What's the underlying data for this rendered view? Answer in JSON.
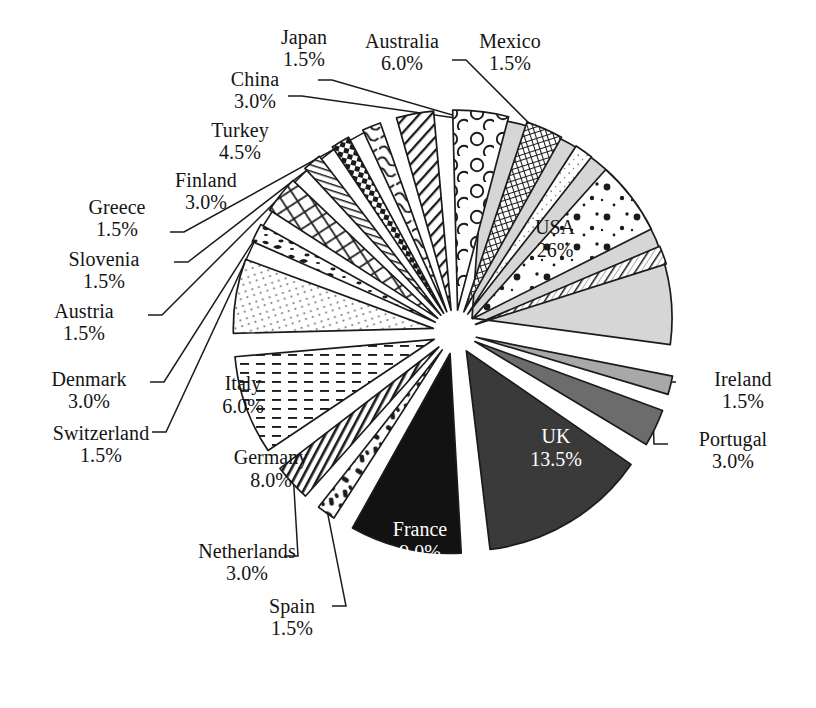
{
  "chart_data": {
    "type": "pie",
    "title": "",
    "subtitle": "",
    "xlabel": "",
    "ylabel": "",
    "legend_position": "none",
    "grid": false,
    "exploded": true,
    "value_unit": "%",
    "center": {
      "x": 455,
      "y": 332
    },
    "radius": 200,
    "categories": [
      "USA",
      "Ireland",
      "Portugal",
      "UK",
      "France",
      "Spain",
      "Netherlands",
      "Germany",
      "Italy",
      "Switzerland",
      "Denmark",
      "Austria",
      "Slovenia",
      "Greece",
      "Finland",
      "Turkey",
      "China",
      "Japan",
      "Australia",
      "Mexico"
    ],
    "values": [
      26.0,
      1.5,
      3.0,
      13.5,
      9.0,
      1.5,
      3.0,
      8.0,
      6.0,
      1.5,
      3.0,
      1.5,
      1.5,
      3.0,
      4.5,
      1.5,
      3.0,
      1.5,
      6.0,
      1.5
    ],
    "slices": [
      {
        "label": "USA",
        "value": 26.0,
        "pct_text": "26%",
        "fill": "#d6d6d6",
        "pattern": "solid",
        "label_placement": "inside",
        "start_deg": -86.0,
        "end_deg": 7.6,
        "explode": 22
      },
      {
        "label": "Ireland",
        "value": 1.5,
        "pct_text": "1.5%",
        "fill": "#a8a8a8",
        "pattern": "solid",
        "label_placement": "outside",
        "start_deg": 11.2,
        "end_deg": 16.6,
        "explode": 22
      },
      {
        "label": "Portugal",
        "value": 3.0,
        "pct_text": "3.0%",
        "fill": "#6c6c6c",
        "pattern": "solid",
        "label_placement": "outside",
        "start_deg": 20.2,
        "end_deg": 31.0,
        "explode": 22
      },
      {
        "label": "UK",
        "value": 13.5,
        "pct_text": "13.5%",
        "fill": "#3a3a3a",
        "pattern": "solid",
        "label_placement": "inside",
        "start_deg": 34.6,
        "end_deg": 83.2,
        "explode": 22
      },
      {
        "label": "France",
        "value": 9.0,
        "pct_text": "9.0%",
        "fill": "#121212",
        "pattern": "solid",
        "label_placement": "inside",
        "start_deg": 86.8,
        "end_deg": 119.2,
        "explode": 22
      },
      {
        "label": "Spain",
        "value": 1.5,
        "pct_text": "1.5%",
        "fill": "#ffffff",
        "pattern": "blotch",
        "label_placement": "outside",
        "start_deg": 122.8,
        "end_deg": 128.2,
        "explode": 22
      },
      {
        "label": "Netherlands",
        "value": 3.0,
        "pct_text": "3.0%",
        "fill": "#ffffff",
        "pattern": "hlines",
        "label_placement": "outside",
        "start_deg": 131.8,
        "end_deg": 142.6,
        "explode": 22
      },
      {
        "label": "Germany",
        "value": 8.0,
        "pct_text": "8.0%",
        "fill": "#ffffff",
        "pattern": "dashes",
        "label_placement": "inside",
        "start_deg": 146.2,
        "end_deg": 175.0,
        "explode": 22
      },
      {
        "label": "Italy",
        "value": 6.0,
        "pct_text": "6.0%",
        "fill": "#ffffff",
        "pattern": "dotlines",
        "label_placement": "inside",
        "start_deg": 178.6,
        "end_deg": 200.2,
        "explode": 22
      },
      {
        "label": "Switzerland",
        "value": 1.5,
        "pct_text": "1.5%",
        "fill": "#ffffff",
        "pattern": "speckle",
        "label_placement": "outside",
        "start_deg": 203.8,
        "end_deg": 209.2,
        "explode": 22
      },
      {
        "label": "Denmark",
        "value": 3.0,
        "pct_text": "3.0%",
        "fill": "#ffffff",
        "pattern": "diamond",
        "label_placement": "outside",
        "start_deg": 212.8,
        "end_deg": 223.6,
        "explode": 22
      },
      {
        "label": "Austria",
        "value": 1.5,
        "pct_text": "1.5%",
        "fill": "#ffffff",
        "pattern": "thinlines",
        "label_placement": "outside",
        "start_deg": 227.2,
        "end_deg": 232.6,
        "explode": 22
      },
      {
        "label": "Slovenia",
        "value": 1.5,
        "pct_text": "1.5%",
        "fill": "#ffffff",
        "pattern": "checker",
        "label_placement": "outside",
        "start_deg": 236.2,
        "end_deg": 241.6,
        "explode": 22
      },
      {
        "label": "Greece",
        "value": 1.5,
        "pct_text": "1.5%",
        "fill": "#ffffff",
        "pattern": "wavy",
        "label_placement": "outside",
        "start_deg": 245.2,
        "end_deg": 250.6,
        "explode": 22
      },
      {
        "label": "Finland",
        "value": 3.0,
        "pct_text": "3.0%",
        "fill": "#ffffff",
        "pattern": "dlines",
        "label_placement": "outside",
        "start_deg": 254.2,
        "end_deg": 265.0,
        "explode": 22
      },
      {
        "label": "Turkey",
        "value": 4.5,
        "pct_text": "4.5%",
        "fill": "#ffffff",
        "pattern": "circles",
        "label_placement": "outside",
        "start_deg": 268.6,
        "end_deg": 284.8,
        "explode": 22
      },
      {
        "label": "China",
        "value": 3.0,
        "pct_text": "3.0%",
        "fill": "#ffffff",
        "pattern": "grid",
        "label_placement": "outside",
        "start_deg": 288.4,
        "end_deg": 299.2,
        "explode": 22
      },
      {
        "label": "Japan",
        "value": 1.5,
        "pct_text": "1.5%",
        "fill": "#ffffff",
        "pattern": "finedot",
        "label_placement": "outside",
        "start_deg": 302.8,
        "end_deg": 308.2,
        "explode": 22
      },
      {
        "label": "Australia",
        "value": 6.0,
        "pct_text": "6.0%",
        "fill": "#ffffff",
        "pattern": "polka",
        "label_placement": "inside",
        "start_deg": 311.8,
        "end_deg": 333.4,
        "explode": 22
      },
      {
        "label": "Mexico",
        "value": 1.5,
        "pct_text": "1.5%",
        "fill": "#ffffff",
        "pattern": "hrule",
        "label_placement": "outside",
        "start_deg": 337.0,
        "end_deg": 342.4,
        "explode": 22
      }
    ]
  },
  "labels": {
    "japan": {
      "name": "Japan",
      "pct": "1.5%"
    },
    "australia": {
      "name": "Australia",
      "pct": "6.0%"
    },
    "mexico": {
      "name": "Mexico",
      "pct": "1.5%"
    },
    "china": {
      "name": "China",
      "pct": "3.0%"
    },
    "turkey": {
      "name": "Turkey",
      "pct": "4.5%"
    },
    "finland": {
      "name": "Finland",
      "pct": "3.0%"
    },
    "greece": {
      "name": "Greece",
      "pct": "1.5%"
    },
    "slovenia": {
      "name": "Slovenia",
      "pct": "1.5%"
    },
    "austria": {
      "name": "Austria",
      "pct": "1.5%"
    },
    "denmark": {
      "name": "Denmark",
      "pct": "3.0%"
    },
    "switzerland": {
      "name": "Switzerland",
      "pct": "1.5%"
    },
    "netherlands": {
      "name": "Netherlands",
      "pct": "3.0%"
    },
    "spain": {
      "name": "Spain",
      "pct": "1.5%"
    },
    "ireland": {
      "name": "Ireland",
      "pct": "1.5%"
    },
    "portugal": {
      "name": "Portugal",
      "pct": "3.0%"
    }
  },
  "inside_labels": {
    "usa": {
      "name": "USA",
      "pct": "26%"
    },
    "uk": {
      "name": "UK",
      "pct": "13.5%"
    },
    "france": {
      "name": "France",
      "pct": "9.0%"
    },
    "germany": {
      "name": "Germany",
      "pct": "8.0%"
    },
    "italy": {
      "name": "Italy",
      "pct": "6.0%"
    }
  },
  "colors": {
    "usa": "#d6d6d6",
    "ireland": "#a8a8a8",
    "portugal": "#6c6c6c",
    "uk": "#3a3a3a",
    "france": "#121212",
    "outline": "#1b1b1b",
    "background": "#ffffff"
  }
}
